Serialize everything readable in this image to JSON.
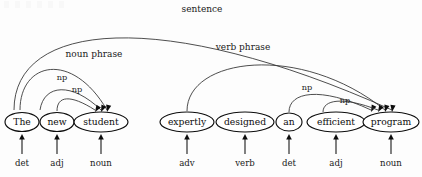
{
  "figure": {
    "background_color": "#fdfdfd",
    "stroke_color": "#3a3a3a",
    "node_fill": "#ffffff",
    "node_stroke": "#0d0d0d"
  },
  "words": [
    {
      "id": "the",
      "text": "The",
      "cx": 22,
      "cy": 122,
      "rx": 17,
      "ry": 9.5,
      "pos": "det",
      "pos_x": 22,
      "pos_y": 163
    },
    {
      "id": "new",
      "text": "new",
      "cx": 57,
      "cy": 122,
      "rx": 17,
      "ry": 9.5,
      "pos": "adj",
      "pos_x": 57,
      "pos_y": 163
    },
    {
      "id": "student",
      "text": "student",
      "cx": 101,
      "cy": 122,
      "rx": 27,
      "ry": 10,
      "pos": "noun",
      "pos_x": 101,
      "pos_y": 163
    },
    {
      "id": "expertly",
      "text": "expertly",
      "cx": 187,
      "cy": 122,
      "rx": 27,
      "ry": 10,
      "pos": "adv",
      "pos_x": 187,
      "pos_y": 163
    },
    {
      "id": "designed",
      "text": "designed",
      "cx": 245,
      "cy": 122,
      "rx": 29,
      "ry": 10,
      "pos": "verb",
      "pos_x": 245,
      "pos_y": 163
    },
    {
      "id": "an",
      "text": "an",
      "cx": 289,
      "cy": 122,
      "rx": 13,
      "ry": 9,
      "pos": "det",
      "pos_x": 289,
      "pos_y": 163
    },
    {
      "id": "efficient",
      "text": "efficient",
      "cx": 336,
      "cy": 122,
      "rx": 29,
      "ry": 10,
      "pos": "adj",
      "pos_x": 336,
      "pos_y": 163
    },
    {
      "id": "program",
      "text": "program",
      "cx": 391,
      "cy": 122,
      "rx": 28,
      "ry": 10,
      "pos": "noun",
      "pos_x": 391,
      "pos_y": 163
    }
  ],
  "arcs": [
    {
      "id": "arc-np-new-student",
      "label": "np",
      "from": "new",
      "to": "student",
      "label_x": 77,
      "label_y": 92,
      "path": "M 57 111 C 57 96 70 94 95 110",
      "arrow_x": 95,
      "arrow_y": 112,
      "arrow_angle": 32
    },
    {
      "id": "arc-np-the-student",
      "label": "np",
      "from": "The",
      "to": "student",
      "label_x": 62,
      "label_y": 80,
      "path": "M 40 110 C 44 84 72 82 101 110",
      "arrow_x": 101,
      "arrow_y": 112,
      "arrow_angle": 24
    },
    {
      "id": "arc-noun-phrase",
      "label": "noun phrase",
      "from": "The",
      "to": "student",
      "label_x": 94,
      "label_y": 57,
      "path": "M 20 110 C 20 62 72 50 107 110",
      "arrow_x": 107,
      "arrow_y": 112,
      "arrow_angle": 14
    },
    {
      "id": "arc-np-an-program",
      "label": "np",
      "from": "an",
      "to": "program",
      "label_x": 307,
      "label_y": 90,
      "path": "M 289 112 C 289 92 320 86 371 110",
      "arrow_x": 371,
      "arrow_y": 112,
      "arrow_angle": 26
    },
    {
      "id": "arc-np-efficient-program",
      "label": "np",
      "from": "efficient",
      "to": "program",
      "label_x": 345,
      "label_y": 103,
      "path": "M 323 112 C 323 100 342 96 378 110",
      "arrow_x": 378,
      "arrow_y": 112,
      "arrow_angle": 30
    },
    {
      "id": "arc-verb-phrase",
      "label": "verb phrase",
      "from": "expertly",
      "to": "program",
      "label_x": 243,
      "label_y": 50,
      "path": "M 187 111 C 187 58 300 42 385 110",
      "arrow_x": 385,
      "arrow_y": 112,
      "arrow_angle": 16
    },
    {
      "id": "arc-sentence",
      "label": "sentence",
      "from": "The",
      "to": "program",
      "label_x": 202,
      "label_y": 12,
      "path": "M 14 110 C 14 22 160 6 392 110",
      "arrow_x": 392,
      "arrow_y": 112,
      "arrow_angle": 8
    }
  ],
  "pos_arrows": {
    "stem_top_y": 136,
    "stem_bottom_y": 154,
    "description": "arrow pointing up from part-of-speech tag to word node"
  }
}
